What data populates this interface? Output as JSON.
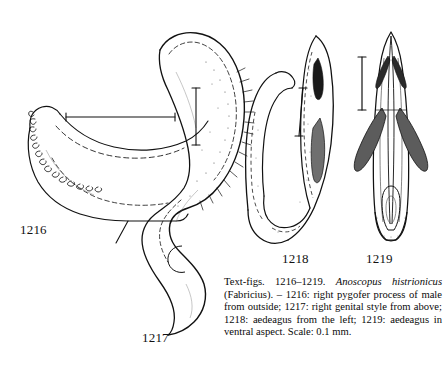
{
  "plate": {
    "background_color": "#ffffff",
    "ink_color": "#111111",
    "figures": [
      {
        "id": "1216",
        "label": "1216",
        "subject": "right pygofer process of male from outside",
        "scale_bar": "horizontal"
      },
      {
        "id": "1217",
        "label": "1217",
        "subject": "right genital style from above",
        "scale_bar": "vertical"
      },
      {
        "id": "1218",
        "label": "1218",
        "subject": "aedeagus from the left",
        "scale_bar": "vertical"
      },
      {
        "id": "1219",
        "label": "1219",
        "subject": "aedeagus in ventral aspect",
        "scale_bar": "vertical"
      }
    ]
  },
  "caption": {
    "prefix": "Text-figs. 1216–1219. ",
    "species": "Anoscopus histrionicus",
    "body": " (Fabricius). – 1216: right pygofer process of male from outside; 1217: right genital style from above; 1218: aedeagus from the left; 1219: aedeagus in ventral aspect. Scale: 0.1 mm."
  }
}
